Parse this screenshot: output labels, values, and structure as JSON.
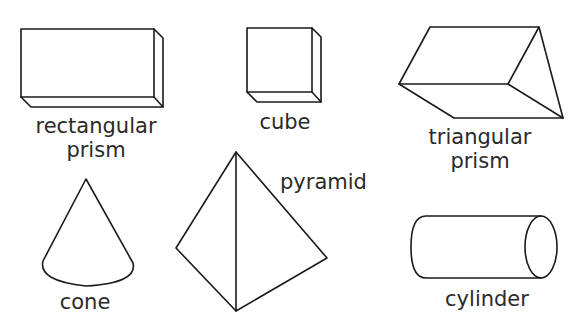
{
  "shapes": {
    "rectangular_prism": {
      "label_line1": "rectangular",
      "label_line2": "prism"
    },
    "cube": {
      "label": "cube"
    },
    "triangular_prism": {
      "label_line1": "triangular",
      "label_line2": "prism"
    },
    "cone": {
      "label": "cone"
    },
    "pyramid": {
      "label": "pyramid"
    },
    "cylinder": {
      "label": "cylinder"
    }
  },
  "colors": {
    "stroke": "#1a1a1a",
    "text": "#2a2a2a",
    "background": "#ffffff"
  }
}
